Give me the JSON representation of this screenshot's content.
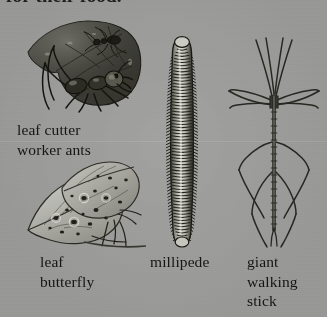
{
  "page": {
    "background_color": "#a3a3a1",
    "text_color": "#171614",
    "cut_off_heading": "for their food."
  },
  "figures": [
    {
      "name": "leaf-cutter-ants",
      "caption": "leaf cutter\nworker ants",
      "subject": "leaf cutter worker ant carrying a cut leaf section, second small ant riding on the leaf",
      "ink_color": "#2b2a26",
      "leaf_color": "#4a4a46"
    },
    {
      "name": "leaf-butterfly",
      "caption": "leaf\nbutterfly",
      "subject": "leaf butterfly with spotted, leaf-shaped closed wings resting on a twig",
      "ink_color": "#3a3a36",
      "wing_color": "#b9b9b4"
    },
    {
      "name": "millipede",
      "caption": "millipede",
      "subject": "millipede shown vertically, elongated body of many repeating segments with legs along both sides",
      "ink_color": "#24241f",
      "body_color": "#cfcfc9"
    },
    {
      "name": "giant-walking-stick",
      "caption": "giant\nwalking\nstick",
      "subject": "giant walking stick insect, line drawing with long slender legs and antennae splayed outward",
      "ink_color": "#2a2a26"
    }
  ]
}
